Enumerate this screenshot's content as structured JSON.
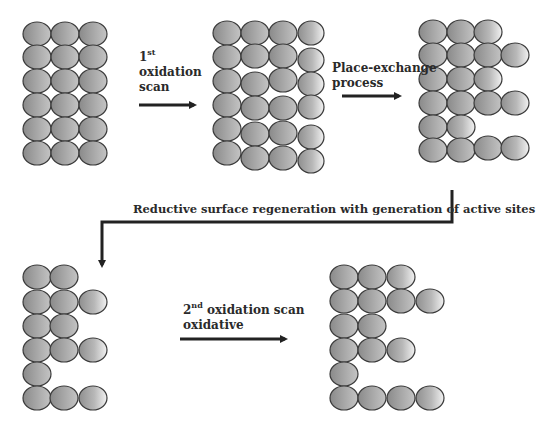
{
  "diagram": {
    "colors": {
      "atom_dark": "#8f8f8f",
      "atom_light": "#f2f2f2",
      "outline": "#3a3a3a",
      "arrow": "#222222"
    },
    "labels": {
      "step1_num": "1",
      "step1_sup": "st",
      "step1_line2": "oxidation",
      "step1_line3": "scan",
      "step2_line1": "Place-exchange",
      "step2_line2": "process",
      "step3": "Reductive surface regeneration with generation of active sites",
      "step4_num": "2",
      "step4_sup": "nd",
      "step4_rest": " oxidation scan",
      "step4_line2": "oxidative"
    },
    "stages": [
      {
        "name": "initial-surface",
        "rows": [
          3,
          3,
          3,
          3,
          3,
          3
        ]
      },
      {
        "name": "after-first-oxidation",
        "rows": [
          4,
          4,
          4,
          4,
          4,
          4
        ]
      },
      {
        "name": "after-place-exchange",
        "rows": [
          3,
          4,
          3,
          4,
          2,
          4
        ]
      },
      {
        "name": "regenerated-surface",
        "rows": [
          2,
          3,
          2,
          3,
          1,
          3
        ]
      },
      {
        "name": "after-second-oxidation",
        "rows": [
          3,
          4,
          2,
          3,
          1,
          4
        ]
      }
    ]
  }
}
